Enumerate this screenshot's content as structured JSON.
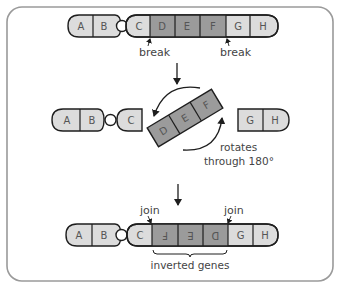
{
  "diagram": {
    "colors": {
      "frame": "#9a9a9a",
      "light_gene": "#dcdcdc",
      "dark_gene": "#9b9b9b",
      "outline": "#1e1e1e",
      "text": "#4a4a4a"
    },
    "stage1": {
      "genes": [
        "A",
        "B",
        "C",
        "D",
        "E",
        "F",
        "G",
        "H"
      ],
      "break_left": "break",
      "break_right": "break"
    },
    "stage2": {
      "left_fragment": [
        "A",
        "B",
        "C"
      ],
      "rotating_segment": [
        "D",
        "E",
        "F"
      ],
      "right_fragment": [
        "G",
        "H"
      ],
      "rotate_label_line1": "rotates",
      "rotate_label_line2": "through 180°"
    },
    "stage3": {
      "genes": [
        "A",
        "B",
        "C",
        "F",
        "E",
        "D",
        "G",
        "H"
      ],
      "inverted": [
        "F",
        "E",
        "D"
      ],
      "join_left": "join",
      "join_right": "join",
      "brace_label": "inverted genes"
    }
  }
}
